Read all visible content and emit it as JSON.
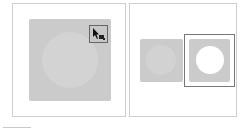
{
  "figure": {
    "panels": [
      {
        "id": "before",
        "description": "Gray square with lighter circle; cursor tool icon in top-right corner",
        "icon": "select-cursor-icon",
        "colors": {
          "square": "#cbcbcb",
          "circle": "#d3d3d3",
          "icon_border": "#666666"
        }
      },
      {
        "id": "after",
        "description": "Original shape and selected result with white circular hole",
        "colors": {
          "square": "#cbcbcb",
          "circle_original": "#d2d2d2",
          "circle_result": "#ffffff",
          "selection_border": "#777777"
        }
      }
    ]
  }
}
